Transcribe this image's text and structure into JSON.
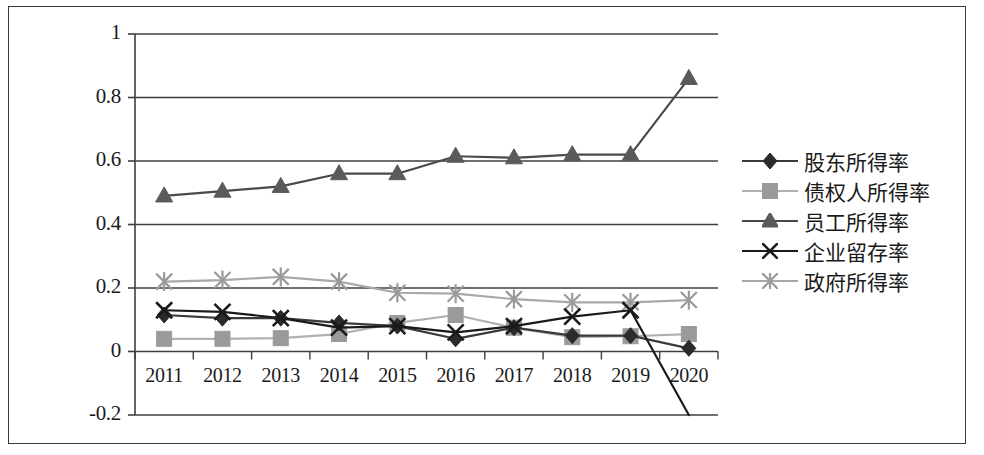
{
  "chart_data": {
    "type": "line",
    "title": "",
    "xlabel": "",
    "ylabel": "",
    "categories": [
      "2011",
      "2012",
      "2013",
      "2014",
      "2015",
      "2016",
      "2017",
      "2018",
      "2019",
      "2020"
    ],
    "ylim": [
      -0.2,
      1.0
    ],
    "ytick_labels": [
      "1",
      "0.8",
      "0.6",
      "0.4",
      "0.2",
      "0",
      "-0.2"
    ],
    "ytick_values": [
      1,
      0.8,
      0.6,
      0.4,
      0.2,
      0,
      -0.2
    ],
    "grid": true,
    "legend_position": "right",
    "series": [
      {
        "name": "股东所得率",
        "marker": "diamond",
        "color": "#2b2b2b",
        "line_color": "#3a3a3a",
        "values": [
          0.115,
          0.105,
          0.105,
          0.09,
          0.08,
          0.04,
          0.075,
          0.05,
          0.05,
          0.01
        ]
      },
      {
        "name": "债权人所得率",
        "marker": "square",
        "color": "#9a9a9a",
        "line_color": "#b0b0b0",
        "values": [
          0.04,
          0.04,
          0.042,
          0.055,
          0.09,
          0.115,
          0.075,
          0.045,
          0.048,
          0.055
        ]
      },
      {
        "name": "员工所得率",
        "marker": "triangle",
        "color": "#5a5a5a",
        "line_color": "#4a4a4a",
        "values": [
          0.49,
          0.505,
          0.52,
          0.56,
          0.56,
          0.615,
          0.61,
          0.62,
          0.62,
          0.86
        ]
      },
      {
        "name": "企业留存率",
        "marker": "cross",
        "color": "#1a1a1a",
        "line_color": "#1a1a1a",
        "values": [
          0.13,
          0.125,
          0.105,
          0.075,
          0.08,
          0.06,
          0.08,
          0.11,
          0.13,
          -0.2
        ]
      },
      {
        "name": "政府所得率",
        "marker": "asterisk",
        "color": "#9a9a9a",
        "line_color": "#a8a8a8",
        "values": [
          0.22,
          0.225,
          0.235,
          0.22,
          0.185,
          0.182,
          0.165,
          0.155,
          0.155,
          0.162
        ]
      }
    ]
  }
}
